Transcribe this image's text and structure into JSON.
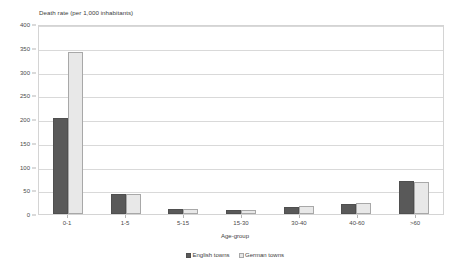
{
  "chart_data": {
    "type": "bar",
    "title": "Death rate (per 1,000 inhabitants)",
    "xlabel": "Age-group",
    "ylabel": "",
    "categories": [
      "0-1",
      "1-5",
      "5-15",
      "15-30",
      "30-40",
      "40-60",
      ">60"
    ],
    "series": [
      {
        "name": "English towns",
        "color": "#595959",
        "values": [
          203,
          42,
          10,
          8,
          14,
          21,
          69
        ]
      },
      {
        "name": "German towns",
        "color": "#e8e8e8",
        "values": [
          341,
          42,
          10,
          9,
          17,
          23,
          67
        ]
      }
    ],
    "ylim": [
      0,
      400
    ],
    "ytick_step": 50,
    "yticks": [
      400,
      350,
      300,
      250,
      200,
      150,
      100,
      50,
      0
    ],
    "grid": true,
    "legend_position": "bottom-center",
    "plot_border_color": "#d4d4d4",
    "gridline_color": "#d9d9d9"
  }
}
